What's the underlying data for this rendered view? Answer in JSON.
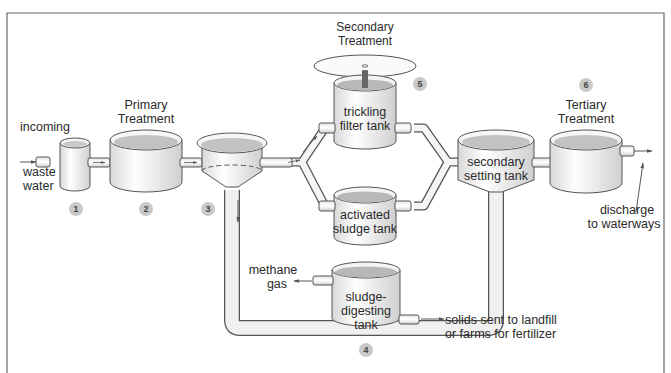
{
  "diagram": {
    "stages": [
      {
        "step": "1",
        "name": "incoming-chamber"
      },
      {
        "step": "2",
        "name": "primary-treatment-tank"
      },
      {
        "step": "3",
        "name": "primary-settling-tank"
      },
      {
        "step": "4",
        "name": "sludge-digesting-tank"
      },
      {
        "step": "5",
        "name": "secondary-treatment"
      },
      {
        "step": "6",
        "name": "tertiary-treatment"
      }
    ],
    "labels": {
      "incoming": "incoming",
      "waste_water_1": "waste",
      "waste_water_2": "water",
      "primary_1": "Primary",
      "primary_2": "Treatment",
      "secondary_1": "Secondary",
      "secondary_2": "Treatment",
      "trickling_1": "trickling",
      "trickling_2": "filter tank",
      "activated_1": "activated",
      "activated_2": "sludge tank",
      "secondary_setting_1": "secondary",
      "secondary_setting_2": "setting tank",
      "tertiary_1": "Tertiary",
      "tertiary_2": "Treatment",
      "discharge_1": "discharge",
      "discharge_2": "to waterways",
      "methane_1": "methane",
      "methane_2": "gas",
      "sludge_1": "sludge-",
      "sludge_2": "digesting",
      "sludge_3": "tank",
      "solids_1": "solids sent to landfill",
      "solids_2": "or farms for fertilizer"
    },
    "badges": {
      "b1": "1",
      "b2": "2",
      "b3": "3",
      "b4": "4",
      "b5": "5",
      "b6": "6"
    },
    "colors": {
      "tank_fill": "#f2f2f2",
      "tank_water": "#bdbdbd",
      "outline": "#555555",
      "badge": "#c9c9c9",
      "frame": "#666666"
    }
  }
}
